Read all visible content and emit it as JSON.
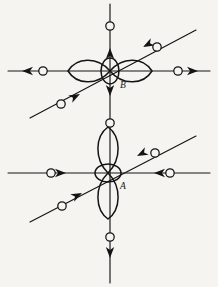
{
  "figure": {
    "canvas": {
      "width": 218,
      "height": 287
    },
    "background_color": "#f6f4f0",
    "ink_color": "#141414"
  },
  "centers": [
    {
      "id": "B",
      "label": "B",
      "label_x": 120,
      "label_y": 88,
      "cx": 110,
      "cy": 71,
      "orbital_orientation": "horizontal",
      "lobe_length": 42,
      "lobe_width": 15,
      "core_rx": 9,
      "core_ry": 13
    },
    {
      "id": "A",
      "label": "A",
      "label_x": 120,
      "label_y": 189,
      "cx": 108,
      "cy": 173,
      "orbital_orientation": "vertical",
      "lobe_length": 46,
      "lobe_width": 14,
      "core_rx": 13,
      "core_ry": 9
    }
  ],
  "axes": [
    {
      "name": "B-horizontal-axis",
      "x1": 8,
      "y1": 71,
      "x2": 210,
      "y2": 71
    },
    {
      "name": "B-diagonal-axis",
      "x1": 30,
      "y1": 118,
      "x2": 196,
      "y2": 30
    },
    {
      "name": "A-horizontal-axis",
      "x1": 8,
      "y1": 173,
      "x2": 210,
      "y2": 173
    },
    {
      "name": "A-diagonal-axis",
      "x1": 30,
      "y1": 222,
      "x2": 196,
      "y2": 136
    },
    {
      "name": "main-vertical-axis",
      "x1": 110,
      "y1": 4,
      "x2": 110,
      "y2": 283
    }
  ],
  "arrows": [
    {
      "name": "arrow-B-left-outgoing",
      "x": 22,
      "y": 71,
      "angle": 180,
      "direction": "outgoing",
      "center": "B"
    },
    {
      "name": "arrow-B-right-outgoing",
      "x": 198,
      "y": 71,
      "angle": 0,
      "direction": "outgoing",
      "center": "B"
    },
    {
      "name": "arrow-B-top-incoming",
      "x": 110,
      "y": 48,
      "angle": 90,
      "direction": "incoming",
      "center": "B"
    },
    {
      "name": "arrow-B-bottom-incoming",
      "x": 110,
      "y": 96,
      "angle": 270,
      "direction": "incoming",
      "center": "B"
    },
    {
      "name": "arrow-B-diagonal-upper-right-incoming",
      "x": 143,
      "y": 47,
      "angle": 208,
      "direction": "incoming",
      "center": "B"
    },
    {
      "name": "arrow-B-diagonal-lower-left-incoming",
      "x": 80,
      "y": 94,
      "angle": 28,
      "direction": "incoming",
      "center": "B"
    },
    {
      "name": "arrow-A-left-incoming",
      "x": 66,
      "y": 173,
      "angle": 0,
      "direction": "incoming",
      "center": "A"
    },
    {
      "name": "arrow-A-right-incoming",
      "x": 154,
      "y": 173,
      "angle": 180,
      "direction": "incoming",
      "center": "A"
    },
    {
      "name": "arrow-A-bottom-outgoing",
      "x": 110,
      "y": 258,
      "angle": 270,
      "direction": "outgoing",
      "center": "A"
    },
    {
      "name": "arrow-A-diagonal-upper-right-incoming",
      "x": 137,
      "y": 156,
      "angle": 207,
      "direction": "incoming",
      "center": "A"
    },
    {
      "name": "arrow-A-diagonal-lower-left-incoming",
      "x": 82,
      "y": 193,
      "angle": 27,
      "direction": "incoming",
      "center": "A"
    }
  ],
  "particles": [
    {
      "name": "particle-B-left",
      "cx": 43,
      "cy": 71,
      "r": 4.2
    },
    {
      "name": "particle-B-right",
      "cx": 178,
      "cy": 71,
      "r": 4.2
    },
    {
      "name": "particle-B-top",
      "cx": 110,
      "cy": 26,
      "r": 4.2
    },
    {
      "name": "particle-B-diagonal-upper-right",
      "cx": 157,
      "cy": 47,
      "r": 4.2
    },
    {
      "name": "particle-B-diagonal-lower-left",
      "cx": 61,
      "cy": 104,
      "r": 4.2
    },
    {
      "name": "particle-between-A-B",
      "cx": 110,
      "cy": 123,
      "r": 4.2
    },
    {
      "name": "particle-A-left",
      "cx": 51,
      "cy": 173,
      "r": 4.2
    },
    {
      "name": "particle-A-right",
      "cx": 170,
      "cy": 173,
      "r": 4.2
    },
    {
      "name": "particle-A-diagonal-upper-right",
      "cx": 155,
      "cy": 153,
      "r": 4.2
    },
    {
      "name": "particle-A-diagonal-lower-left",
      "cx": 62,
      "cy": 206,
      "r": 4.2
    },
    {
      "name": "particle-A-bottom",
      "cx": 110,
      "cy": 237,
      "r": 4.2
    }
  ]
}
